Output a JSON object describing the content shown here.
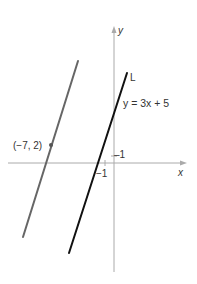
{
  "figure": {
    "axis_x_label": "x",
    "axis_y_label": "y",
    "tick_y_label": "1",
    "tick_x_label": "−1",
    "line_L": {
      "name": "L",
      "equation": "y = 3x + 5",
      "color": "#111111"
    },
    "parallel_line": {
      "point_label": "(−7, 2)",
      "color": "#666666"
    },
    "axis_color": "#aaaaaa"
  }
}
